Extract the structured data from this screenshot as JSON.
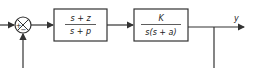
{
  "diagram": {
    "type": "block-diagram",
    "summing_junction": {
      "plus_sign": "+",
      "minus_sign": "−"
    },
    "blocks": [
      {
        "numerator": "s + z",
        "denominator": "s + p"
      },
      {
        "numerator": "K",
        "denominator": "s(s + a)"
      }
    ],
    "output_label": "y",
    "colors": {
      "line": "#333333",
      "background": "#ffffff"
    }
  }
}
